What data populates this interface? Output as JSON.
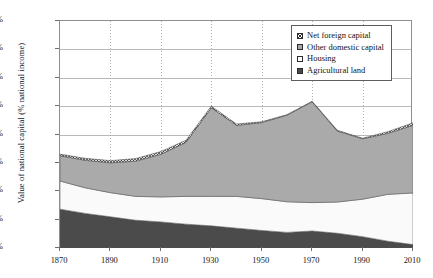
{
  "chart_data": {
    "type": "area",
    "stacked": true,
    "title": "",
    "subtitle": "",
    "xlabel": "",
    "ylabel": "Value of national capital (% national income)",
    "xlim": [
      1870,
      2010
    ],
    "ylim": [
      0,
      800
    ],
    "ytick_labels": [
      "0%",
      "100%",
      "200%",
      "300%",
      "400%",
      "500%",
      "600%",
      "700%",
      "800%"
    ],
    "ytick_values": [
      0,
      100,
      200,
      300,
      400,
      500,
      600,
      700,
      800
    ],
    "xtick_labels": [
      "1870",
      "1890",
      "1910",
      "1930",
      "1950",
      "1970",
      "1990",
      "2010"
    ],
    "xtick_values": [
      1870,
      1890,
      1910,
      1930,
      1950,
      1970,
      1990,
      2010
    ],
    "grid": "horizontal-solid-and-vertical-dotted",
    "legend_position": "top-right",
    "x": [
      1870,
      1880,
      1890,
      1900,
      1910,
      1920,
      1930,
      1940,
      1950,
      1960,
      1970,
      1980,
      1990,
      2000,
      2010
    ],
    "series": [
      {
        "name": "Agricultural land",
        "color": "#4b4b4b",
        "values": [
          137,
          122,
          110,
          98,
          92,
          84,
          78,
          70,
          62,
          55,
          60,
          52,
          40,
          24,
          12
        ]
      },
      {
        "name": "Housing",
        "color": "#fafafa",
        "values": [
          99,
          90,
          85,
          84,
          88,
          98,
          104,
          112,
          112,
          108,
          100,
          110,
          132,
          165,
          182
        ]
      },
      {
        "name": "Other domestic capital",
        "color": "#aaaaaa",
        "values": [
          89,
          97,
          105,
          124,
          150,
          190,
          312,
          250,
          268,
          305,
          355,
          250,
          213,
          215,
          238
        ]
      },
      {
        "name": "Net foreign capital",
        "color": "#dcdcdc",
        "pattern": "crosshatch",
        "values": [
          6,
          7,
          8,
          9,
          10,
          8,
          6,
          5,
          3,
          2,
          2,
          3,
          2,
          6,
          9
        ]
      }
    ],
    "series_totals": [
      331,
      316,
      308,
      315,
      340,
      380,
      500,
      437,
      445,
      470,
      517,
      415,
      387,
      410,
      441
    ],
    "annotations": []
  },
  "legend": {
    "items": [
      {
        "label": "Net foreign capital",
        "swatch": "crosshatch-swatch"
      },
      {
        "label": "Other domestic capital",
        "swatch": "gray-swatch"
      },
      {
        "label": "Housing",
        "swatch": "white-swatch"
      },
      {
        "label": "Agricultural land",
        "swatch": "dark-swatch"
      }
    ]
  },
  "colors": {
    "agricultural_land": "#4b4b4b",
    "housing": "#fafafa",
    "other_domestic_capital": "#aaaaaa",
    "net_foreign_capital": "#dcdcdc",
    "axis": "#8e8e8e",
    "gridline": "#b9b9b9",
    "text": "#151515"
  }
}
